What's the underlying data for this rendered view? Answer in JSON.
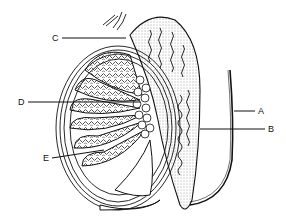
{
  "diagram": {
    "labels": [
      {
        "id": "A",
        "text": "A",
        "x": 258,
        "y": 107
      },
      {
        "id": "B",
        "text": "B",
        "x": 268,
        "y": 125
      },
      {
        "id": "C",
        "text": "C",
        "x": 52,
        "y": 34
      },
      {
        "id": "D",
        "text": "D",
        "x": 18,
        "y": 98
      },
      {
        "id": "E",
        "text": "E",
        "x": 43,
        "y": 154
      }
    ],
    "colors": {
      "line": "#111111",
      "background": "#ffffff"
    }
  }
}
